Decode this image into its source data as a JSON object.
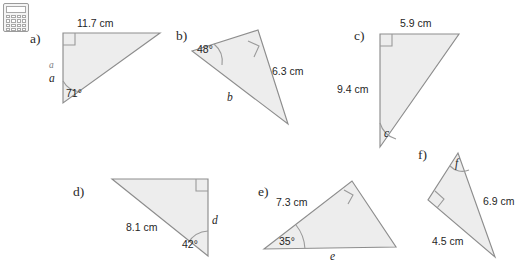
{
  "page": {
    "background_color": "#ffffff",
    "shape_fill_color": "#ededed",
    "shape_stroke_color": "#8d8d8d"
  },
  "calculator_icon": {
    "name": "calculator-icon",
    "key_count": 16
  },
  "figures": [
    {
      "id": "a",
      "letter": "a)",
      "has_right_angle": true,
      "labels": {
        "top_side": "11.7 cm",
        "angle": "71°",
        "unknown_side": "a",
        "unknown_side_ghost": "a"
      }
    },
    {
      "id": "b",
      "letter": "b)",
      "has_right_angle": true,
      "labels": {
        "angle": "48°",
        "right_side": "6.3 cm",
        "unknown_side": "b"
      }
    },
    {
      "id": "c",
      "letter": "c)",
      "has_right_angle": true,
      "labels": {
        "top_side": "5.9 cm",
        "left_side": "9.4 cm",
        "unknown_angle": "c"
      }
    },
    {
      "id": "d",
      "letter": "d)",
      "has_right_angle": true,
      "labels": {
        "hypotenuse": "8.1 cm",
        "angle": "42°",
        "unknown_side": "d"
      }
    },
    {
      "id": "e",
      "letter": "e)",
      "has_right_angle": true,
      "labels": {
        "upper_side": "7.3 cm",
        "angle": "35°",
        "unknown_side": "e"
      }
    },
    {
      "id": "f",
      "letter": "f)",
      "has_right_angle": true,
      "labels": {
        "unknown_angle": "f",
        "right_side": "6.9 cm",
        "lower_left_side": "4.5 cm"
      }
    }
  ]
}
